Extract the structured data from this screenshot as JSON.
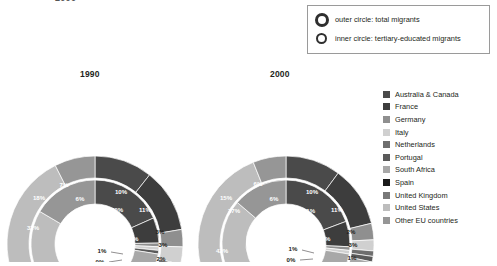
{
  "cut_title": "2000",
  "ring_legend": {
    "rows": [
      {
        "icon": "outer-circle-icon",
        "label": "outer circle: total migrants"
      },
      {
        "icon": "inner-circle-icon",
        "label": "inner circle: tertiary-educated migrants"
      }
    ]
  },
  "legend": {
    "items": [
      {
        "label": "Australia & Canada",
        "color": "#4a4a4a"
      },
      {
        "label": "France",
        "color": "#3d3d3d"
      },
      {
        "label": "Germany",
        "color": "#8f8f8f"
      },
      {
        "label": "Italy",
        "color": "#d0d0d0"
      },
      {
        "label": "Netherlands",
        "color": "#6e6e6e"
      },
      {
        "label": "Portugal",
        "color": "#5a5a5a"
      },
      {
        "label": "South Africa",
        "color": "#a8a8a8"
      },
      {
        "label": "Spain",
        "color": "#1a1a1a"
      },
      {
        "label": "United Kingdom",
        "color": "#787878"
      },
      {
        "label": "United States",
        "color": "#bdbdbd"
      },
      {
        "label": "Other EU countries",
        "color": "#969696"
      }
    ]
  },
  "chart_data": [
    {
      "type": "pie",
      "title": "1990",
      "ring": "outer",
      "unit": "%",
      "categories": [
        "Australia & Canada",
        "France",
        "Germany",
        "Italy",
        "Netherlands",
        "Portugal",
        "South Africa",
        "Spain",
        "United Kingdom",
        "United States",
        "Other EU countries"
      ],
      "values": [
        10,
        11,
        3,
        3,
        2,
        2,
        7,
        2,
        19,
        28,
        7
      ],
      "labels": [
        "10%",
        "11%",
        "3%",
        "3%",
        "2%",
        "2%",
        "7%",
        "2%",
        "19%",
        "28%",
        "7%"
      ]
    },
    {
      "type": "pie",
      "title": "1990",
      "ring": "inner",
      "unit": "%",
      "categories": [
        "Australia & Canada",
        "France",
        "Germany",
        "Italy",
        "Netherlands",
        "Portugal",
        "South Africa",
        "Spain",
        "United Kingdom",
        "United States",
        "Other EU countries"
      ],
      "values": [
        20,
        7,
        1,
        1,
        0,
        1,
        7,
        1,
        21,
        32,
        18
      ],
      "labels": [
        "20%",
        "7%",
        "1%",
        "1%",
        "0%",
        "1%",
        "7%",
        "1%",
        "21%",
        "32%",
        "18%"
      ]
    },
    {
      "type": "pie",
      "title": "2000",
      "ring": "outer",
      "unit": "%",
      "categories": [
        "Australia & Canada",
        "France",
        "Germany",
        "Italy",
        "Netherlands",
        "Portugal",
        "South Africa",
        "Spain",
        "United Kingdom",
        "United States",
        "Other EU countries"
      ],
      "values": [
        10,
        11,
        3,
        2,
        1,
        1,
        7,
        2,
        25,
        31,
        6
      ],
      "labels": [
        "10%",
        "11%",
        "3%",
        "2%",
        "1%",
        "1%",
        "7%",
        "2%",
        "25%",
        "31%",
        "6%"
      ]
    },
    {
      "type": "pie",
      "title": "2000",
      "ring": "inner",
      "unit": "%",
      "categories": [
        "Australia & Canada",
        "France",
        "Germany",
        "Italy",
        "Netherlands",
        "Portugal",
        "South Africa",
        "Spain",
        "United Kingdom",
        "United States",
        "Other EU countries"
      ],
      "values": [
        21,
        7,
        1,
        1,
        0,
        0,
        7,
        1,
        19,
        37,
        15
      ],
      "labels": [
        "21%",
        "7%",
        "1%",
        "1%",
        "0%",
        "0%",
        "7%",
        "1%",
        "19%",
        "37%",
        "15%"
      ]
    }
  ],
  "chart1990": {
    "title": "1990",
    "outer": [
      {
        "label": "10%",
        "x": 116,
        "y": 110,
        "tone": "dark"
      },
      {
        "label": "11%",
        "x": 140,
        "y": 128,
        "tone": "dark"
      },
      {
        "label": "3%",
        "x": 155,
        "y": 150,
        "tone": "light"
      },
      {
        "label": "3%",
        "x": 158,
        "y": 163,
        "tone": "light"
      },
      {
        "label": "2%",
        "x": 156,
        "y": 177,
        "tone": "light"
      },
      {
        "label": "2%",
        "x": 151,
        "y": 188,
        "tone": "light"
      },
      {
        "label": "7%",
        "x": 122,
        "y": 215,
        "tone": "dark"
      },
      {
        "label": "19%",
        "x": 88,
        "y": 228,
        "tone": "dark"
      },
      {
        "label": "28%",
        "x": 48,
        "y": 215,
        "tone": "dark"
      },
      {
        "label": "2%",
        "x": 69,
        "y": 229,
        "tone": "light"
      },
      {
        "label": "7%",
        "x": 59,
        "y": 103,
        "tone": "dark"
      }
    ],
    "inner": [
      {
        "label": "20%",
        "x": 112,
        "y": 128,
        "tone": "dark"
      },
      {
        "label": "7%",
        "x": 129,
        "y": 157,
        "tone": "dark"
      },
      {
        "label": "2%",
        "x": 120,
        "y": 178,
        "tone": "dark"
      },
      {
        "label": "7%",
        "x": 96,
        "y": 192,
        "tone": "dark"
      },
      {
        "label": "21%",
        "x": 33,
        "y": 191,
        "tone": "dark"
      },
      {
        "label": "32%",
        "x": 28,
        "y": 146,
        "tone": "dark"
      },
      {
        "label": "18%",
        "x": 34,
        "y": 116,
        "tone": "dark"
      },
      {
        "label": "6%",
        "x": 75,
        "y": 117,
        "tone": "dark"
      }
    ],
    "leaders": [
      {
        "label": "1%",
        "lx": 97,
        "ly": 169,
        "x1": 106,
        "y1": 170,
        "x2": 118,
        "y2": 172
      },
      {
        "label": "0%",
        "lx": 95,
        "ly": 180,
        "x1": 104,
        "y1": 180,
        "x2": 117,
        "y2": 178
      },
      {
        "label": "1%",
        "lx": 92,
        "ly": 196,
        "x1": 101,
        "y1": 196,
        "x2": 112,
        "y2": 192
      }
    ]
  },
  "chart2000": {
    "title": "2000",
    "outer": [
      {
        "label": "10%",
        "x": 116,
        "y": 110,
        "tone": "dark"
      },
      {
        "label": "11%",
        "x": 141,
        "y": 128,
        "tone": "dark"
      },
      {
        "label": "2%",
        "x": 155,
        "y": 150,
        "tone": "light"
      },
      {
        "label": "3%",
        "x": 157,
        "y": 163,
        "tone": "light"
      },
      {
        "label": "1%",
        "x": 156,
        "y": 176,
        "tone": "light"
      },
      {
        "label": "1%",
        "x": 152,
        "y": 187,
        "tone": "light"
      },
      {
        "label": "7%",
        "x": 124,
        "y": 214,
        "tone": "dark"
      },
      {
        "label": "25%",
        "x": 90,
        "y": 230,
        "tone": "dark"
      },
      {
        "label": "31%",
        "x": 44,
        "y": 212,
        "tone": "dark"
      },
      {
        "label": "2%",
        "x": 68,
        "y": 230,
        "tone": "light"
      },
      {
        "label": "6%",
        "x": 62,
        "y": 102,
        "tone": "dark"
      }
    ],
    "inner": [
      {
        "label": "21%",
        "x": 113,
        "y": 129,
        "tone": "dark"
      },
      {
        "label": "7%",
        "x": 130,
        "y": 157,
        "tone": "dark"
      },
      {
        "label": "7%",
        "x": 98,
        "y": 193,
        "tone": "dark"
      },
      {
        "label": "19%",
        "x": 58,
        "y": 201,
        "tone": "dark"
      },
      {
        "label": "42%",
        "x": 26,
        "y": 169,
        "tone": "dark"
      },
      {
        "label": "37%",
        "x": 38,
        "y": 129,
        "tone": "dark"
      },
      {
        "label": "15%",
        "x": 30,
        "y": 116,
        "tone": "dark"
      },
      {
        "label": "6%",
        "x": 78,
        "y": 117,
        "tone": "dark"
      }
    ],
    "leaders": [
      {
        "label": "1%",
        "lx": 97,
        "ly": 167,
        "x1": 106,
        "y1": 168,
        "x2": 118,
        "y2": 171
      },
      {
        "label": "0%",
        "lx": 95,
        "ly": 178,
        "x1": 104,
        "y1": 178,
        "x2": 117,
        "y2": 177
      },
      {
        "label": "0%",
        "lx": 88,
        "ly": 194,
        "x1": 97,
        "y1": 194,
        "x2": 110,
        "y2": 190
      }
    ]
  }
}
